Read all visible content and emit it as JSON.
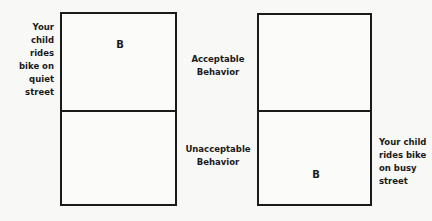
{
  "left_panel": {
    "side_label": [
      "Your",
      "child",
      "rides",
      "bike on",
      "quiet",
      "street"
    ],
    "top_cell_mark": "B",
    "bottom_cell_mark": ""
  },
  "middle_labels": {
    "top": [
      "Acceptable",
      "Behavior"
    ],
    "bottom": [
      "Unacceptable",
      "Behavior"
    ]
  },
  "right_panel": {
    "side_label": [
      "Your child",
      "rides bike",
      "on busy",
      "street"
    ],
    "top_cell_mark": "",
    "bottom_cell_mark": "B"
  }
}
